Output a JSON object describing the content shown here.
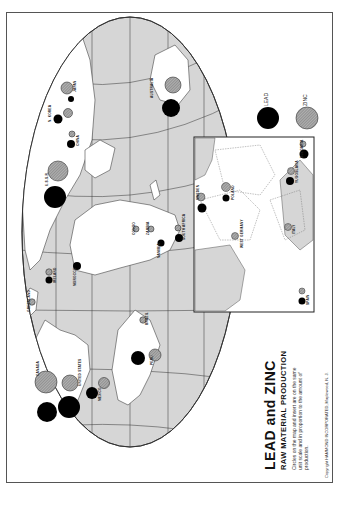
{
  "map": {
    "title": "LEAD and ZINC",
    "subtitle": "RAW MATERIAL PRODUCTION",
    "note": "Circles on the map and insert are on the same unit scale and in proportion to the amount of production.",
    "copyright": "Copyright HAMMOND INCORPORATED, Maplewood, N. J.",
    "colors": {
      "ocean": "#d6d6d6",
      "land": "#ffffff",
      "lead": "#000000",
      "zinc": "#9a9a9a",
      "grid": "#222222"
    },
    "legend": [
      {
        "label": "LEAD",
        "type": "lead"
      },
      {
        "label": "ZINC",
        "type": "zinc"
      }
    ],
    "producers": [
      {
        "name": "CANADA",
        "lead": 16,
        "zinc": 22
      },
      {
        "name": "UNITED STATES",
        "lead": 22,
        "zinc": 14
      },
      {
        "name": "MEXICO",
        "lead": 11,
        "zinc": 10
      },
      {
        "name": "PERU",
        "lead": 14,
        "zinc": 12
      },
      {
        "name": "BRAZIL",
        "lead": 0,
        "zinc": 6
      },
      {
        "name": "GREENLAND",
        "lead": 0,
        "zinc": 6
      },
      {
        "name": "IRELAND",
        "lead": 6,
        "zinc": 6
      },
      {
        "name": "MOROCCO",
        "lead": 7,
        "zinc": 0
      },
      {
        "name": "U.S.S.R.",
        "lead": 22,
        "zinc": 18
      },
      {
        "name": "CHINA",
        "lead": 7,
        "zinc": 5
      },
      {
        "name": "N. KOREA",
        "lead": 7,
        "zinc": 6
      },
      {
        "name": "JAPAN",
        "lead": 5,
        "zinc": 11
      },
      {
        "name": "AUSTRALIA",
        "lead": 18,
        "zinc": 15
      },
      {
        "name": "CONGO",
        "lead": 0,
        "zinc": 5
      },
      {
        "name": "ZAMBIA",
        "lead": 0,
        "zinc": 5
      },
      {
        "name": "NAMIBIA",
        "lead": 6,
        "zinc": 0
      },
      {
        "name": "SOUTH AFRICA",
        "lead": 7,
        "zinc": 5
      }
    ],
    "insert_producers": [
      {
        "name": "SWEDEN",
        "lead": 8,
        "zinc": 7
      },
      {
        "name": "POLAND",
        "lead": 6,
        "zinc": 8
      },
      {
        "name": "WEST GERMANY",
        "lead": 0,
        "zinc": 7
      },
      {
        "name": "ITALY",
        "lead": 0,
        "zinc": 6
      },
      {
        "name": "YUGOSLAVIA",
        "lead": 7,
        "zinc": 6
      },
      {
        "name": "BULGARIA",
        "lead": 8,
        "zinc": 6
      },
      {
        "name": "SPAIN",
        "lead": 6,
        "zinc": 5
      }
    ]
  }
}
